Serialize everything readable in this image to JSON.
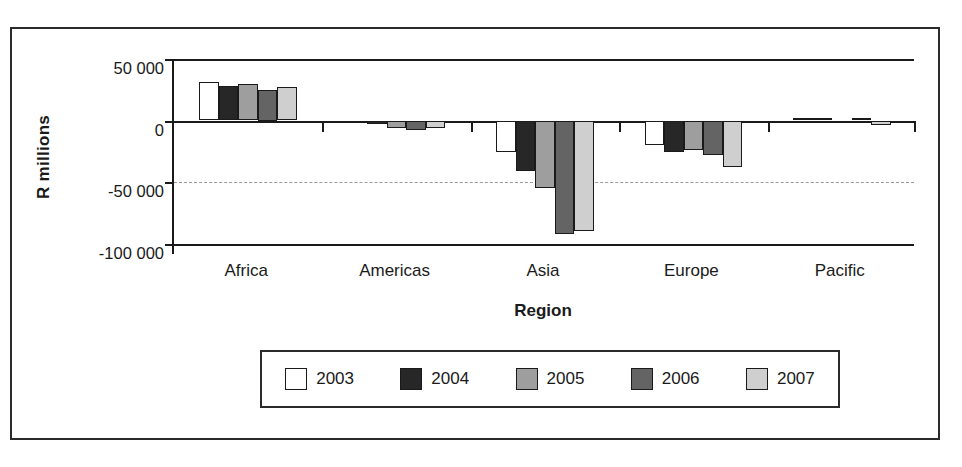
{
  "chart_data": {
    "type": "bar",
    "title": "",
    "subtitle": "",
    "xlabel": "Region",
    "ylabel": "R millions",
    "categories": [
      "Africa",
      "Americas",
      "Asia",
      "Europe",
      "Pacific"
    ],
    "series": [
      {
        "name": "2003",
        "color": "#ffffff",
        "values": [
          31000,
          -2000,
          -26000,
          -20000,
          0
        ]
      },
      {
        "name": "2004",
        "color": "#272727",
        "values": [
          28000,
          -3000,
          -41000,
          -26000,
          0
        ]
      },
      {
        "name": "2005",
        "color": "#9e9e9e",
        "values": [
          30000,
          -6000,
          -55000,
          -24000,
          -1000
        ]
      },
      {
        "name": "2006",
        "color": "#646464",
        "values": [
          25000,
          -8000,
          -92000,
          -28000,
          0
        ]
      },
      {
        "name": "2007",
        "color": "#cfcfcf",
        "values": [
          27000,
          -6000,
          -90000,
          -38000,
          -4000
        ]
      }
    ],
    "ylim": [
      -100000,
      50000
    ],
    "yticks": [
      50000,
      0,
      -50000,
      -100000
    ],
    "ytick_labels": [
      "50 000",
      "0",
      "-50 000",
      "-100 000"
    ],
    "gridlines": [
      "-50 000 dashed"
    ],
    "grid": false,
    "legend_position": "bottom",
    "legend_entries": [
      "2003",
      "2004",
      "2005",
      "2006",
      "2007"
    ]
  }
}
